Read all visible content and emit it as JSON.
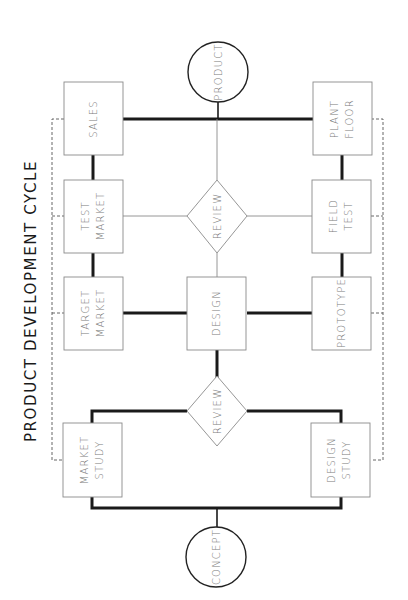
{
  "title": "PRODUCT DEVELOPMENT CYCLE",
  "colors": {
    "background": "#ffffff",
    "thick_connector": "#1a1a1a",
    "thin_connector": "#8a8a8a",
    "node_text": "#7a7a7a",
    "title_text": "#1a1a1a"
  },
  "orientation": "rotated -90deg (reads bottom-to-top)",
  "nodes": {
    "product": {
      "shape": "circle",
      "label": "PRODUCT"
    },
    "concept": {
      "shape": "circle",
      "label": "CONCEPT"
    },
    "sales": {
      "shape": "box",
      "lines": [
        "SALES"
      ]
    },
    "test_market": {
      "shape": "box",
      "lines": [
        "TEST",
        "MARKET"
      ]
    },
    "target_market": {
      "shape": "box",
      "lines": [
        "TARGET",
        "MARKET"
      ]
    },
    "market_study": {
      "shape": "box",
      "lines": [
        "MARKET",
        "STUDY"
      ]
    },
    "plant_floor": {
      "shape": "box",
      "lines": [
        "PLANT",
        "FLOOR"
      ]
    },
    "field_test": {
      "shape": "box",
      "lines": [
        "FIELD",
        "TEST"
      ]
    },
    "prototype": {
      "shape": "box",
      "lines": [
        "PROTOTYPE"
      ]
    },
    "design_study": {
      "shape": "box",
      "lines": [
        "DESIGN",
        "STUDY"
      ]
    },
    "design": {
      "shape": "box",
      "lines": [
        "DESIGN"
      ]
    },
    "review_upper": {
      "shape": "diamond",
      "label": "REVIEW"
    },
    "review_lower": {
      "shape": "diamond",
      "label": "REVIEW"
    }
  },
  "connections": [
    {
      "from": "concept",
      "to": "market_study",
      "style": "thick"
    },
    {
      "from": "concept",
      "to": "design_study",
      "style": "thick"
    },
    {
      "from": "market_study",
      "to": "review_lower",
      "style": "thick"
    },
    {
      "from": "design_study",
      "to": "review_lower",
      "style": "thick"
    },
    {
      "from": "review_lower",
      "to": "design",
      "style": "thick"
    },
    {
      "from": "design",
      "to": "target_market",
      "style": "thick"
    },
    {
      "from": "design",
      "to": "prototype",
      "style": "thick"
    },
    {
      "from": "target_market",
      "to": "test_market",
      "style": "thick"
    },
    {
      "from": "prototype",
      "to": "field_test",
      "style": "thick"
    },
    {
      "from": "design",
      "to": "review_upper",
      "style": "thin"
    },
    {
      "from": "review_upper",
      "to": "test_market",
      "style": "thin"
    },
    {
      "from": "review_upper",
      "to": "field_test",
      "style": "thin"
    },
    {
      "from": "review_upper",
      "to": "product",
      "style": "thin"
    },
    {
      "from": "test_market",
      "to": "sales",
      "style": "thick"
    },
    {
      "from": "field_test",
      "to": "plant_floor",
      "style": "thick"
    },
    {
      "from": "sales",
      "to": "product",
      "style": "thick"
    },
    {
      "from": "plant_floor",
      "to": "product",
      "style": "thick"
    }
  ],
  "feedback_lines": [
    {
      "side": "market",
      "style": "dashed",
      "links": [
        "sales",
        "test_market",
        "target_market",
        "market_study"
      ]
    },
    {
      "side": "engineering",
      "style": "dashed",
      "links": [
        "plant_floor",
        "field_test",
        "prototype",
        "design_study"
      ]
    }
  ]
}
